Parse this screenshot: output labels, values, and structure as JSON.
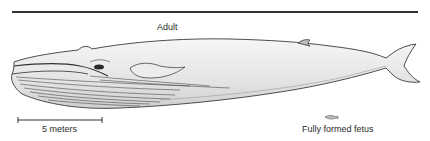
{
  "figure": {
    "title_label": "Adult",
    "scale_bar": {
      "label": "5 meters",
      "length_meters": 5
    },
    "fetus": {
      "label": "Fully formed fetus"
    },
    "colors": {
      "line": "#333333",
      "body_shade": "#e9e9e9",
      "grooves": "#555555",
      "background": "#ffffff"
    }
  }
}
